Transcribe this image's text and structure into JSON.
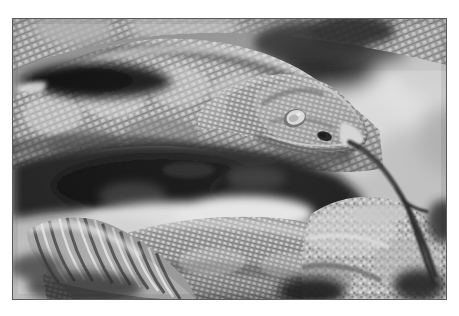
{
  "page": {
    "background_color": "#ffffff",
    "width": 459,
    "height": 316
  },
  "photo": {
    "subject": "rattlesnake",
    "alt_text": "Black and white photograph of a coiled rattlesnake with its forked tongue extended, showing its rattle at lower left",
    "mode": "grayscale",
    "frame": {
      "border_color": "#5a5a5a",
      "border_width": 1,
      "left": 12,
      "top": 18,
      "width": 435,
      "height": 282
    },
    "palette": {
      "shadow_black": "#111111",
      "deep_gray": "#3a3a3a",
      "mid_gray": "#8c8c8c",
      "light_gray": "#c8c8c8",
      "highlight_white": "#f2f2f2"
    },
    "regions": [
      {
        "name": "upper-body-coil",
        "tone": "mid-gray scaled body",
        "note": "diagonal scaled coil across top half"
      },
      {
        "name": "dark-shadow-band",
        "tone": "deep black",
        "note": "shadow gap between upper coil and lower coil"
      },
      {
        "name": "snake-head",
        "tone": "light gray",
        "note": "head at center-right with pale eye and dark nostril"
      },
      {
        "name": "forked-tongue",
        "tone": "near black",
        "note": "slender dark tongue flicking down and to the right"
      },
      {
        "name": "rattle",
        "tone": "light gray banded",
        "note": "segmented rattle at lower left"
      },
      {
        "name": "lower-body-coil",
        "tone": "mid gray keeled scales",
        "note": "coil running across the bottom"
      },
      {
        "name": "rock-right",
        "tone": "bright mottled",
        "note": "rough sunlit rock at right edge"
      },
      {
        "name": "background-blur",
        "tone": "bright white blur",
        "note": "out of focus background upper right"
      }
    ]
  }
}
